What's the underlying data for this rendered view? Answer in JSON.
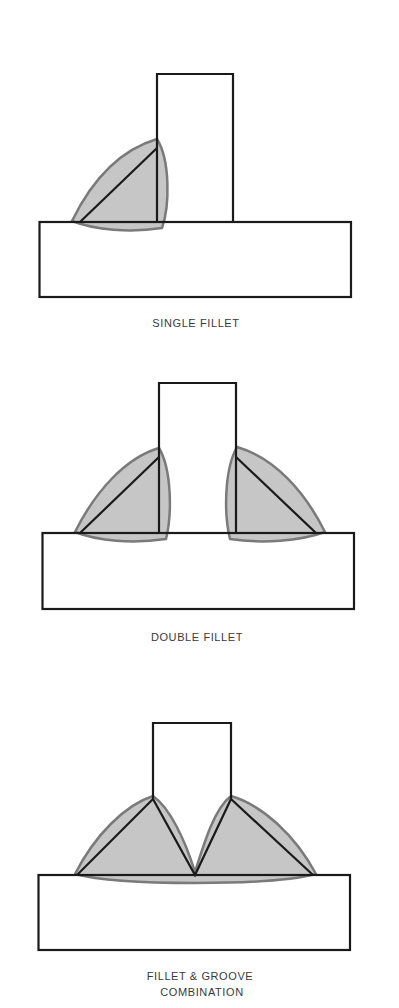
{
  "colors": {
    "line": "#1a1a1a",
    "weld_fill": "#c6c6c6",
    "weld_outline": "#7a7a7a",
    "label": "#3a3a3a",
    "background": "#ffffff"
  },
  "figures": [
    {
      "id": "single-fillet",
      "labels": [
        "SINGLE FILLET"
      ]
    },
    {
      "id": "double-fillet",
      "labels": [
        "DOUBLE FILLET"
      ]
    },
    {
      "id": "fillet-groove",
      "labels": [
        "FILLET & GROOVE",
        "COMBINATION"
      ]
    }
  ]
}
